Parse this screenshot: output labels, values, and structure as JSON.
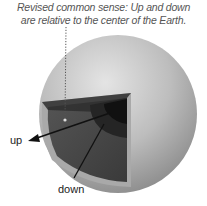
{
  "caption": {
    "line1": "Revised common sense: Up and down",
    "line2": "are relative to the center of the Earth."
  },
  "labels": {
    "up": "up",
    "down": "down"
  },
  "colors": {
    "sphere_light": "#d9d9d9",
    "sphere_mid": "#b5b5b5",
    "sphere_dark": "#8e8e8e",
    "crust": "#a8a8a8",
    "mantle": "#4a4a4a",
    "outer_core": "#2a2a2a",
    "inner_core": "#121212",
    "arrow": "#111111",
    "dotted_line": "#555555"
  }
}
